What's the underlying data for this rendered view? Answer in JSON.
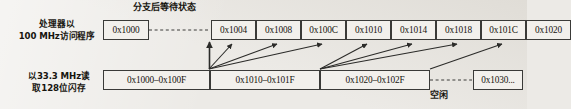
{
  "figure": {
    "title_annotation": "分支后等待状态",
    "idle_annotation": "空闲"
  },
  "processor_row": {
    "label_line1": "处理器以",
    "label_line2": "100 MHz访问程序",
    "first_cell": "0x1000",
    "cells": [
      "0x1004",
      "0x1008",
      "0x100C",
      "0x1010",
      "0x1014",
      "0x1018",
      "0x101C",
      "0x1020"
    ]
  },
  "flash_row": {
    "label_line1": "以33.3 MHz读",
    "label_line2": "取128位闪存",
    "cells": [
      "0x1000–0x100F",
      "0x1010–0x101F",
      "0x1020–0x102F"
    ],
    "trailing_cell": "0x1030..."
  },
  "colors": {
    "paper": "#eceae6",
    "ink": "#17150f",
    "rule": "#3a3a38",
    "cell_fill": "#f2f0ec"
  }
}
